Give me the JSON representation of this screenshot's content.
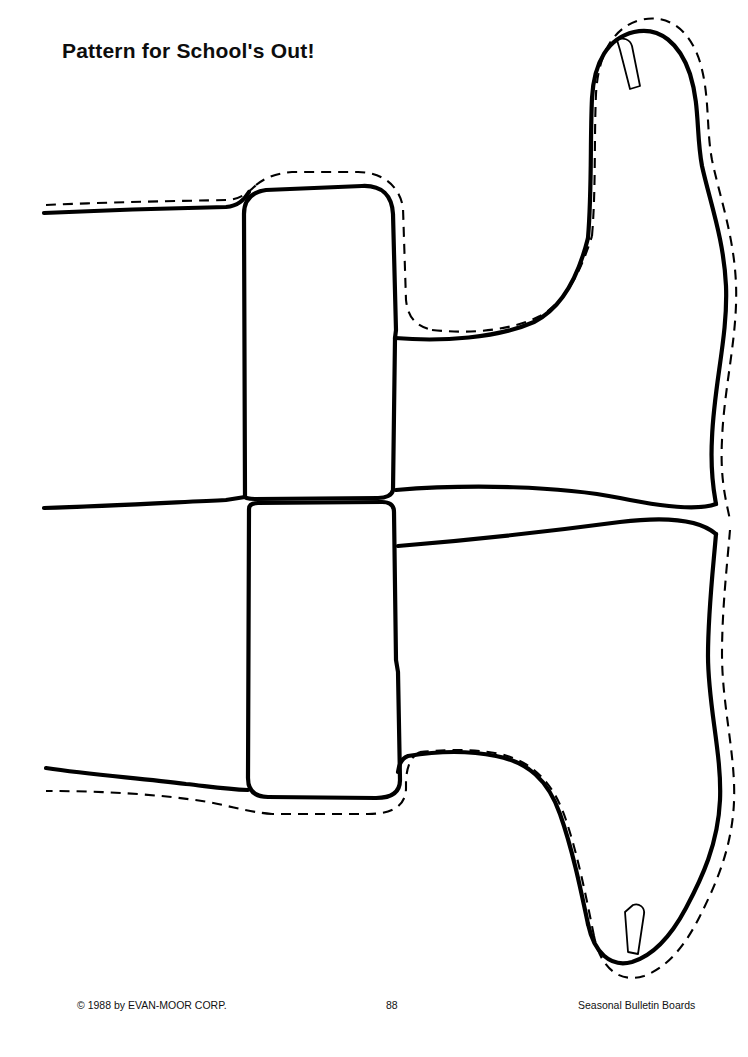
{
  "page": {
    "title": "Pattern for School's Out!",
    "width": 748,
    "height": 1057,
    "background_color": "#ffffff",
    "ink_color": "#000000"
  },
  "footer": {
    "copyright": "© 1988 by EVAN-MOOR CORP.",
    "page_number": "88",
    "series": "Seasonal Bulletin Boards"
  },
  "artwork": {
    "name": "bow-pattern",
    "description": "Line-art sewing pattern of a large bow with two loops, a center knot and two streamers running off the left edge of the page.",
    "line_styles": {
      "cut_line": "solid",
      "seam_allowance_line": "dashed"
    },
    "parts": [
      "upper-right-loop",
      "lower-right-loop",
      "center-knot-upper",
      "center-knot-lower",
      "upper-left-streamer",
      "lower-left-streamer",
      "upper-fold-tab",
      "lower-fold-tab"
    ]
  }
}
